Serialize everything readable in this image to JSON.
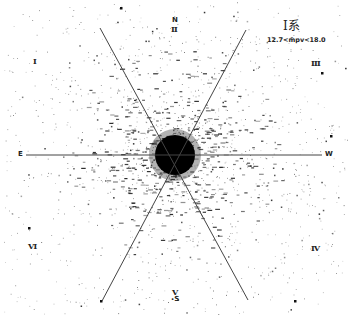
{
  "figure": {
    "title": "Ⅰ系",
    "magnitude_range": "12.7<m̄pv<18.0",
    "colors": {
      "ink": "#222222",
      "background": "#ffffff"
    },
    "center": [
      175,
      155
    ],
    "core_radius": 20
  },
  "directions": {
    "north": "N",
    "south": "S",
    "east": "E",
    "west": "W"
  },
  "sectors": [
    {
      "id": "I",
      "label": "Ⅰ"
    },
    {
      "id": "II",
      "label": "Ⅱ"
    },
    {
      "id": "III",
      "label": "Ⅲ"
    },
    {
      "id": "IV",
      "label": "Ⅳ"
    },
    {
      "id": "V",
      "label": "Ⅴ"
    },
    {
      "id": "VI",
      "label": "Ⅵ"
    }
  ],
  "dividers": [
    {
      "x1": 26,
      "y1": 155,
      "x2": 322,
      "y2": 155
    },
    {
      "x1": 100,
      "y1": 28,
      "x2": 248,
      "y2": 300
    },
    {
      "x1": 246,
      "y1": 30,
      "x2": 102,
      "y2": 301
    }
  ],
  "chart_data": {
    "type": "scatter",
    "center_px": [
      175,
      155
    ],
    "sectors": [
      "Ⅰ",
      "Ⅱ",
      "Ⅲ",
      "Ⅳ",
      "Ⅴ",
      "Ⅵ"
    ],
    "axis_labels": {
      "top": "N",
      "bottom": "S",
      "left": "E",
      "right": "W"
    }
  }
}
